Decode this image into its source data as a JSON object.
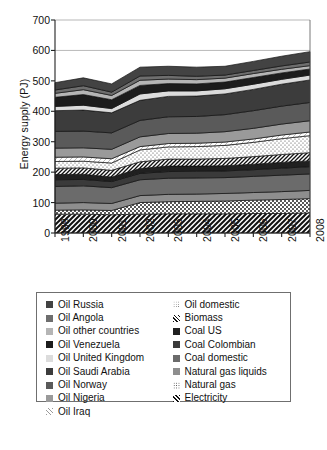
{
  "chart_data": {
    "type": "area",
    "stacked": true,
    "title": "",
    "xlabel": "",
    "ylabel": "Energy supply (PJ)",
    "ylim": [
      0,
      700
    ],
    "ytick_step": 100,
    "yticks": [
      "0",
      "100",
      "200",
      "300",
      "400",
      "500",
      "600",
      "700"
    ],
    "grid": false,
    "legend_position": "below",
    "categories": [
      "1999",
      "2000",
      "2001",
      "2002",
      "2003",
      "2004",
      "2005",
      "2006",
      "2007",
      "2008"
    ],
    "x": [
      1999,
      2000,
      2001,
      2002,
      2003,
      2004,
      2005,
      2006,
      2007,
      2008
    ],
    "stack_order_bottom_to_top": [
      "Electricity",
      "Natural gas",
      "Natural gas liquids",
      "Coal domestic",
      "Coal Colombian",
      "Coal US",
      "Biomass",
      "Oil domestic",
      "Oil Iraq",
      "Oil Nigeria",
      "Oil Norway",
      "Oil Saudi Arabia",
      "Oil United Kingdom",
      "Oil Venezuela",
      "Oil other countries",
      "Oil Angola",
      "Oil Russia"
    ],
    "series": [
      {
        "name": "Electricity",
        "fill": "#ffffff",
        "pattern": "hatch-steep",
        "values": [
          62,
          62,
          60,
          62,
          63,
          63,
          63,
          64,
          64,
          66
        ]
      },
      {
        "name": "Natural gas",
        "fill": "#ffffff",
        "pattern": "dots",
        "values": [
          13,
          14,
          14,
          38,
          40,
          41,
          42,
          44,
          46,
          47
        ]
      },
      {
        "name": "Natural gas liquids",
        "fill": "#8e8e8e",
        "pattern": "none",
        "values": [
          23,
          24,
          23,
          23,
          24,
          24,
          25,
          25,
          26,
          27
        ]
      },
      {
        "name": "Coal domestic",
        "fill": "#6b6b6b",
        "pattern": "none",
        "values": [
          55,
          55,
          52,
          52,
          53,
          53,
          52,
          53,
          54,
          54
        ]
      },
      {
        "name": "Coal Colombian",
        "fill": "#3a3a3a",
        "pattern": "none",
        "values": [
          22,
          21,
          20,
          21,
          22,
          22,
          22,
          22,
          23,
          24
        ]
      },
      {
        "name": "Coal US",
        "fill": "#202020",
        "pattern": "none",
        "values": [
          17,
          17,
          15,
          16,
          18,
          17,
          17,
          18,
          19,
          19
        ]
      },
      {
        "name": "Biomass",
        "fill": "#ffffff",
        "pattern": "hatch-thin",
        "values": [
          21,
          21,
          22,
          22,
          23,
          23,
          24,
          25,
          26,
          27
        ]
      },
      {
        "name": "Oil domestic",
        "fill": "#ffffff",
        "pattern": "dots-fine",
        "values": [
          22,
          22,
          24,
          39,
          40,
          41,
          43,
          47,
          52,
          56
        ]
      },
      {
        "name": "Oil Iraq",
        "fill": "#ffffff",
        "pattern": "hatch-faint",
        "values": [
          14,
          14,
          14,
          11,
          11,
          11,
          11,
          11,
          12,
          12
        ]
      },
      {
        "name": "Oil Nigeria",
        "fill": "#9a9a9a",
        "pattern": "none",
        "values": [
          30,
          30,
          31,
          32,
          33,
          33,
          34,
          35,
          36,
          37
        ]
      },
      {
        "name": "Oil Norway",
        "fill": "#5a5a5a",
        "pattern": "none",
        "values": [
          55,
          55,
          54,
          54,
          55,
          55,
          56,
          58,
          59,
          60
        ]
      },
      {
        "name": "Oil Saudi Arabia",
        "fill": "#3c3c3c",
        "pattern": "none",
        "values": [
          68,
          69,
          66,
          66,
          67,
          67,
          68,
          70,
          72,
          74
        ]
      },
      {
        "name": "Oil United Kingdom",
        "fill": "#dcdcdc",
        "pattern": "none",
        "values": [
          14,
          16,
          14,
          21,
          18,
          17,
          17,
          17,
          16,
          16
        ]
      },
      {
        "name": "Oil Venezuela",
        "fill": "#1c1c1c",
        "pattern": "none",
        "values": [
          30,
          35,
          29,
          28,
          24,
          23,
          22,
          22,
          21,
          20
        ]
      },
      {
        "name": "Oil other countries",
        "fill": "#b5b5b5",
        "pattern": "none",
        "values": [
          13,
          16,
          14,
          17,
          15,
          14,
          13,
          13,
          12,
          11
        ]
      },
      {
        "name": "Oil Angola",
        "fill": "#6e6e6e",
        "pattern": "none",
        "values": [
          11,
          13,
          11,
          14,
          12,
          11,
          10,
          10,
          11,
          12
        ]
      },
      {
        "name": "Oil Russia",
        "fill": "#434343",
        "pattern": "none",
        "values": [
          24,
          26,
          27,
          29,
          30,
          30,
          29,
          30,
          32,
          34
        ]
      }
    ],
    "totals": [
      494,
      510,
      490,
      545,
      548,
      545,
      548,
      564,
      601,
      636
    ]
  },
  "legend": {
    "left_column": [
      {
        "label": "Oil Russia",
        "swatch": "#434343",
        "pattern": "none"
      },
      {
        "label": "Oil Angola",
        "swatch": "#6e6e6e",
        "pattern": "none"
      },
      {
        "label": "Oil other countries",
        "swatch": "#b5b5b5",
        "pattern": "none"
      },
      {
        "label": "Oil Venezuela",
        "swatch": "#1c1c1c",
        "pattern": "none"
      },
      {
        "label": "Oil United Kingdom",
        "swatch": "#dcdcdc",
        "pattern": "none"
      },
      {
        "label": "Oil Saudi Arabia",
        "swatch": "#3c3c3c",
        "pattern": "none"
      },
      {
        "label": "Oil Norway",
        "swatch": "#5a5a5a",
        "pattern": "none"
      },
      {
        "label": "Oil Nigeria",
        "swatch": "#9a9a9a",
        "pattern": "none"
      },
      {
        "label": "Oil Iraq",
        "swatch": "#ffffff",
        "pattern": "hatch-faint"
      }
    ],
    "right_column": [
      {
        "label": "Oil domestic",
        "swatch": "#ffffff",
        "pattern": "dots-fine"
      },
      {
        "label": "Biomass",
        "swatch": "#ffffff",
        "pattern": "hatch-thin"
      },
      {
        "label": "Coal US",
        "swatch": "#202020",
        "pattern": "none"
      },
      {
        "label": "Coal Colombian",
        "swatch": "#3a3a3a",
        "pattern": "none"
      },
      {
        "label": "Coal domestic",
        "swatch": "#6b6b6b",
        "pattern": "none"
      },
      {
        "label": "Natural gas liquids",
        "swatch": "#8e8e8e",
        "pattern": "none"
      },
      {
        "label": "Natural gas",
        "swatch": "#ffffff",
        "pattern": "dots"
      },
      {
        "label": "Electricity",
        "swatch": "#ffffff",
        "pattern": "hatch-steep"
      }
    ]
  }
}
